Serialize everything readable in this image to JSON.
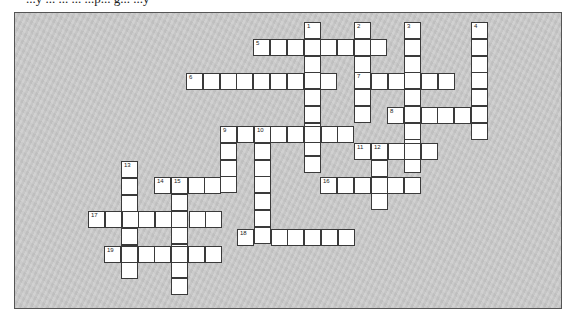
{
  "page": {
    "header_text": "...y ... ... ... ...p... g... ...y",
    "board_background": "#c9c9c9",
    "cell_background": "#ffffff",
    "cell_border": "#3a3a3a"
  },
  "crossword": {
    "cell_size": 16.75,
    "words": [
      {
        "number": "1",
        "direction": "down",
        "x": 304,
        "y": 22,
        "length": 9
      },
      {
        "number": "2",
        "direction": "down",
        "x": 354,
        "y": 22,
        "length": 6
      },
      {
        "number": "3",
        "direction": "down",
        "x": 404,
        "y": 22,
        "length": 9
      },
      {
        "number": "4",
        "direction": "down",
        "x": 471,
        "y": 22,
        "length": 7
      },
      {
        "number": "5",
        "direction": "across",
        "x": 253,
        "y": 39,
        "length": 8
      },
      {
        "number": "6",
        "direction": "across",
        "x": 186,
        "y": 73,
        "length": 9
      },
      {
        "number": "7",
        "direction": "across",
        "x": 354,
        "y": 73,
        "length": 6
      },
      {
        "number": "8",
        "direction": "across",
        "x": 387,
        "y": 107,
        "length": 6
      },
      {
        "number": "9",
        "direction": "across",
        "x": 220,
        "y": 126,
        "length": 8
      },
      {
        "number": "9",
        "direction": "down",
        "x": 220,
        "y": 126,
        "length": 4,
        "label_hidden": true
      },
      {
        "number": "10",
        "direction": "down",
        "x": 254,
        "y": 126,
        "length": 7
      },
      {
        "number": "11",
        "direction": "across",
        "x": 354,
        "y": 143,
        "length": 5
      },
      {
        "number": "12",
        "direction": "down",
        "x": 371,
        "y": 143,
        "length": 4
      },
      {
        "number": "13",
        "direction": "down",
        "x": 121,
        "y": 161,
        "length": 7
      },
      {
        "number": "14",
        "direction": "across",
        "x": 154,
        "y": 177,
        "length": 5
      },
      {
        "number": "15",
        "direction": "down",
        "x": 171,
        "y": 177,
        "length": 7
      },
      {
        "number": "16",
        "direction": "across",
        "x": 320,
        "y": 177,
        "length": 6
      },
      {
        "number": "17",
        "direction": "across",
        "x": 88,
        "y": 211,
        "length": 8
      },
      {
        "number": "18",
        "direction": "across",
        "x": 237,
        "y": 229,
        "length": 7
      },
      {
        "number": "19",
        "direction": "across",
        "x": 104,
        "y": 246,
        "length": 7
      }
    ]
  }
}
